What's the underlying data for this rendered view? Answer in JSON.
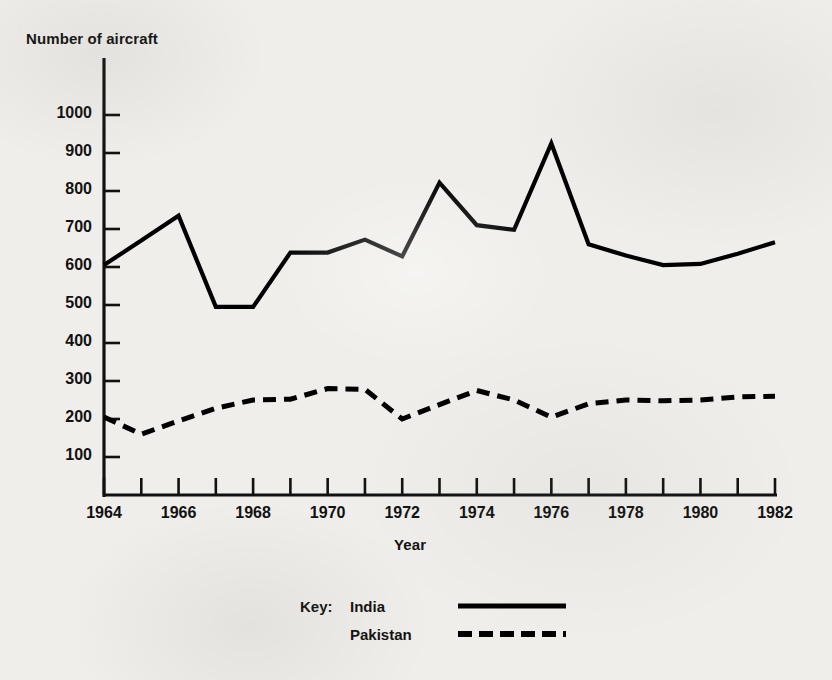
{
  "chart_data": {
    "type": "line",
    "title": "",
    "xlabel": "Year",
    "ylabel": "Number of aircraft",
    "xlim": [
      1964,
      1982
    ],
    "ylim": [
      0,
      1050
    ],
    "grid": false,
    "legend_position": "bottom-center",
    "legend_key_word": "Key:",
    "y_ticks": [
      100,
      200,
      300,
      400,
      500,
      600,
      700,
      800,
      900,
      1000
    ],
    "y_tick_labels": [
      "100",
      "200",
      "300",
      "400",
      "500",
      "600",
      "700",
      "800",
      "900",
      "1000"
    ],
    "x_ticks": [
      1964,
      1965,
      1966,
      1967,
      1968,
      1969,
      1970,
      1971,
      1972,
      1973,
      1974,
      1975,
      1976,
      1977,
      1978,
      1979,
      1980,
      1981,
      1982
    ],
    "x_tick_labels_shown": [
      "1964",
      "1966",
      "1968",
      "1970",
      "1972",
      "1974",
      "1976",
      "1978",
      "1980",
      "1982"
    ],
    "x": [
      1964,
      1965,
      1966,
      1967,
      1968,
      1969,
      1970,
      1971,
      1972,
      1973,
      1974,
      1975,
      1976,
      1977,
      1978,
      1979,
      1980,
      1981,
      1982
    ],
    "series": [
      {
        "name": "India",
        "style": "solid",
        "color": "#000000",
        "values": [
          605,
          670,
          735,
          495,
          495,
          638,
          638,
          672,
          628,
          822,
          710,
          698,
          925,
          660,
          630,
          605,
          608,
          635,
          665
        ]
      },
      {
        "name": "Pakistan",
        "style": "dashed",
        "color": "#000000",
        "values": [
          205,
          160,
          195,
          228,
          250,
          252,
          280,
          278,
          200,
          238,
          275,
          250,
          205,
          240,
          250,
          248,
          250,
          258,
          260
        ]
      }
    ]
  },
  "geometry": {
    "plot_left": 104,
    "plot_right": 775,
    "plot_bottom": 495,
    "y_axis_top": 58,
    "y_100_px": 457,
    "y_1000_px": 115
  }
}
